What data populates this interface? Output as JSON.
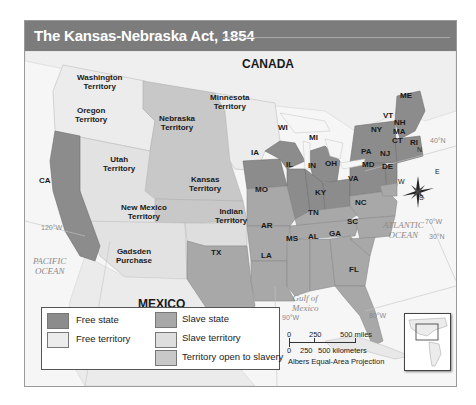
{
  "title": "The Kansas-Nebraska Act, 1854",
  "map_labels": {
    "countries": {
      "canada": "CANADA",
      "mexico": "MEXICO"
    },
    "territories": {
      "washington": [
        "Washington",
        "Territory"
      ],
      "oregon": [
        "Oregon",
        "Territory"
      ],
      "minnesota": [
        "Minnesota",
        "Territory"
      ],
      "nebraska": [
        "Nebraska",
        "Territory"
      ],
      "utah": [
        "Utah",
        "Territory"
      ],
      "kansas": [
        "Kansas",
        "Territory"
      ],
      "new_mexico": [
        "New Mexico",
        "Territory"
      ],
      "indian": [
        "Indian",
        "Territory"
      ],
      "gadsden": [
        "Gadsden",
        "Purchase"
      ]
    },
    "states": {
      "CA": "CA",
      "WI": "WI",
      "MI": "MI",
      "IA": "IA",
      "IL": "IL",
      "IN": "IN",
      "OH": "OH",
      "MO": "MO",
      "KY": "KY",
      "TN": "TN",
      "AR": "AR",
      "MS": "MS",
      "AL": "AL",
      "GA": "GA",
      "LA": "LA",
      "TX": "TX",
      "FL": "FL",
      "SC": "SC",
      "NC": "NC",
      "VA": "VA",
      "MD": "MD",
      "DE": "DE",
      "PA": "PA",
      "NJ": "NJ",
      "NY": "NY",
      "VT": "VT",
      "NH": "NH",
      "MA": "MA",
      "CT": "CT",
      "RI": "RI",
      "ME": "ME"
    },
    "oceans": {
      "pacific": [
        "PACIFIC",
        "OCEAN"
      ],
      "atlantic": [
        "ATLANTIC",
        "OCEAN"
      ],
      "gulf": [
        "Gulf of",
        "Mexico"
      ]
    },
    "coordinates": {
      "lat40": "40°N",
      "lat30": "30°N",
      "lon70": "70°W",
      "lon80": "80°W",
      "lon90": "90°W",
      "lon120": "120°W"
    },
    "compass": {
      "n": "N",
      "s": "S",
      "e": "E",
      "w": "W"
    }
  },
  "legend": {
    "items": [
      {
        "label": "Free state",
        "color": "#8c8c8c"
      },
      {
        "label": "Slave state",
        "color": "#a8a8a8"
      },
      {
        "label": "Free territory",
        "color": "#ececec"
      },
      {
        "label": "Slave territory",
        "color": "#dedede"
      },
      {
        "label": "Territory open to slavery",
        "color": "#c8c8c8"
      }
    ]
  },
  "scale": {
    "miles_0": "0",
    "miles_250": "250",
    "miles_500": "500 miles",
    "km_0": "0",
    "km_250": "250",
    "km_500": "500 kilometers",
    "projection": "Albers Equal-Area Projection"
  }
}
